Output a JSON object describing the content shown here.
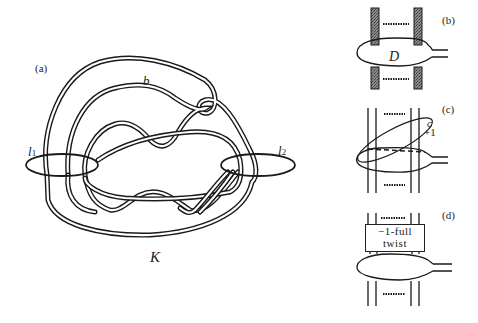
{
  "figure": {
    "panels": [
      {
        "id": "a",
        "label": "(a)",
        "knot_label": "K",
        "band_label": "b",
        "loop_labels": [
          "l1",
          "l2"
        ]
      },
      {
        "id": "b",
        "label": "(b)",
        "disk_label": "D"
      },
      {
        "id": "c",
        "label": "(c)",
        "curve_label": "c",
        "framing_label": "+1"
      },
      {
        "id": "d",
        "label": "(d)",
        "box_text_line1": "−1-full",
        "box_text_line2": "twist"
      }
    ]
  },
  "labels": {
    "a": "(a)",
    "b": "(b)",
    "c": "(c)",
    "d": "(d)",
    "K": "K",
    "band": "b",
    "l1_main": "l",
    "l1_sub": "1",
    "l2_main": "l",
    "l2_sub": "2",
    "D": "D",
    "curve_c": "c",
    "plus_one": "+1",
    "twist_line1": "−1-full",
    "twist_line2": "twist"
  },
  "colors": {
    "ink": "#1a1a1a",
    "shade": "#6a6a6a",
    "background": "#ffffff"
  }
}
